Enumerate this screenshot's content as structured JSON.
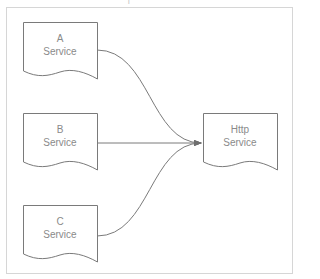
{
  "header": {
    "clipped_text": "— — — — —  —  —  |  — — — — — — —"
  },
  "diagram": {
    "nodes": [
      {
        "id": "a",
        "line1": "A",
        "line2": "Service",
        "shape": "document"
      },
      {
        "id": "b",
        "line1": "B",
        "line2": "Service",
        "shape": "document"
      },
      {
        "id": "c",
        "line1": "C",
        "line2": "Service",
        "shape": "document"
      },
      {
        "id": "http",
        "line1": "Http",
        "line2": "Service",
        "shape": "document"
      }
    ],
    "edges": [
      {
        "from": "A Service",
        "to": "Http Service",
        "style": "curved"
      },
      {
        "from": "B Service",
        "to": "Http Service",
        "style": "straight"
      },
      {
        "from": "C Service",
        "to": "Http Service",
        "style": "curved"
      }
    ],
    "colors": {
      "stroke": "#7a7a7a",
      "text": "#8a8a8a",
      "frame": "#d6d6d6"
    }
  }
}
